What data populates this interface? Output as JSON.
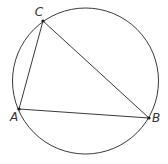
{
  "diagram": {
    "type": "triangle-inscribed-in-circle",
    "circle": {
      "cx": 85.5,
      "cy": 81,
      "r": 73
    },
    "points": [
      {
        "id": "A",
        "label": "A",
        "x": 19,
        "y": 109,
        "label_x": 14,
        "label_y": 121
      },
      {
        "id": "B",
        "label": "B",
        "x": 149,
        "y": 118,
        "label_x": 156,
        "label_y": 122
      },
      {
        "id": "C",
        "label": "C",
        "x": 43,
        "y": 21,
        "label_x": 39,
        "label_y": 16
      }
    ],
    "segments": [
      {
        "name": "AB",
        "from": "A",
        "to": "B"
      },
      {
        "name": "BC",
        "from": "B",
        "to": "C"
      },
      {
        "name": "CA",
        "from": "C",
        "to": "A"
      }
    ],
    "colors": {
      "stroke": "#3a3a3a",
      "point": "#1a1a1a",
      "label": "#333333",
      "background": "#ffffff"
    }
  }
}
